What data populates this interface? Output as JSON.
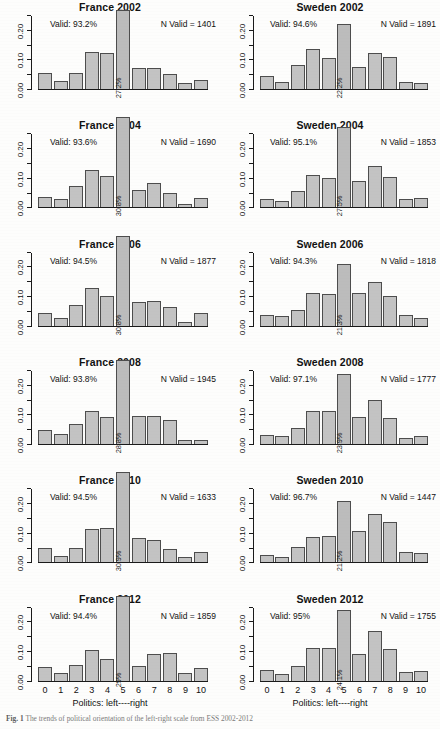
{
  "figure": {
    "caption_label": "Fig. 1",
    "caption_text": "The trends of political orientation of the left-right scale from ESS 2002-2012"
  },
  "axis": {
    "y_ticks": [
      "0.00",
      "0.10",
      "0.20"
    ],
    "y_min": 0.0,
    "y_max": 0.25,
    "x_labels": [
      "0",
      "1",
      "2",
      "3",
      "4",
      "5",
      "6",
      "7",
      "8",
      "9",
      "10"
    ],
    "x_title": "Politics: left----right"
  },
  "chart_data": {
    "type": "bar",
    "title": "The trends of political orientation of the left-right scale from ESS 2002-2012",
    "xlabel": "Politics: left----right",
    "ylabel": "Proportion",
    "ylim": [
      0,
      0.25
    ],
    "grid": false,
    "legend": "none",
    "categories": [
      "0",
      "1",
      "2",
      "3",
      "4",
      "5",
      "6",
      "7",
      "8",
      "9",
      "10"
    ],
    "panels": [
      {
        "title": "France 2002",
        "country": "France",
        "year": "2002",
        "valid_label": "Valid: 93.2%",
        "n_valid_label": "N Valid = 1401",
        "valid_pct": 93.2,
        "n_valid": 1401,
        "peak_label": "27.2%",
        "peak_category": "5",
        "values": [
          0.056,
          0.03,
          0.059,
          0.128,
          0.126,
          0.272,
          0.075,
          0.074,
          0.053,
          0.025,
          0.035
        ]
      },
      {
        "title": "Sweden 2002",
        "country": "Sweden",
        "year": "2002",
        "valid_label": "Valid: 94.6%",
        "n_valid_label": "N Valid = 1891",
        "valid_pct": 94.6,
        "n_valid": 1891,
        "peak_label": "22.2%",
        "peak_category": "5",
        "values": [
          0.047,
          0.028,
          0.086,
          0.137,
          0.107,
          0.222,
          0.079,
          0.126,
          0.11,
          0.026,
          0.025
        ]
      },
      {
        "title": "France 2004",
        "country": "France",
        "year": "2004",
        "valid_label": "Valid: 93.6%",
        "n_valid_label": "N Valid = 1690",
        "valid_pct": 93.6,
        "n_valid": 1690,
        "peak_label": "30.8%",
        "peak_category": "5",
        "values": [
          0.039,
          0.033,
          0.076,
          0.131,
          0.108,
          0.308,
          0.062,
          0.084,
          0.053,
          0.013,
          0.034
        ]
      },
      {
        "title": "Sweden 2004",
        "country": "Sweden",
        "year": "2004",
        "valid_label": "Valid: 95.1%",
        "n_valid_label": "N Valid = 1853",
        "valid_pct": 95.1,
        "n_valid": 1853,
        "peak_label": "27.5%",
        "peak_category": "5",
        "values": [
          0.032,
          0.024,
          0.06,
          0.114,
          0.102,
          0.275,
          0.094,
          0.142,
          0.105,
          0.032,
          0.035
        ]
      },
      {
        "title": "France 2006",
        "country": "France",
        "year": "2006",
        "valid_label": "Valid: 94.5%",
        "n_valid_label": "N Valid = 1877",
        "valid_pct": 94.5,
        "n_valid": 1877,
        "peak_label": "30.8%",
        "peak_category": "5",
        "values": [
          0.047,
          0.03,
          0.073,
          0.129,
          0.103,
          0.308,
          0.085,
          0.086,
          0.066,
          0.017,
          0.046
        ]
      },
      {
        "title": "Sweden 2006",
        "country": "Sweden",
        "year": "2006",
        "valid_label": "Valid: 94.3%",
        "n_valid_label": "N Valid = 1818",
        "valid_pct": 94.3,
        "n_valid": 1818,
        "peak_label": "21.3%",
        "peak_category": "5",
        "values": [
          0.04,
          0.037,
          0.056,
          0.113,
          0.11,
          0.213,
          0.113,
          0.151,
          0.104,
          0.038,
          0.03
        ]
      },
      {
        "title": "France 2008",
        "country": "France",
        "year": "2008",
        "valid_label": "Valid: 93.8%",
        "n_valid_label": "N Valid = 1945",
        "valid_pct": 93.8,
        "n_valid": 1945,
        "peak_label": "28.8%",
        "peak_category": "5",
        "values": [
          0.05,
          0.036,
          0.072,
          0.116,
          0.095,
          0.288,
          0.099,
          0.098,
          0.086,
          0.018,
          0.018
        ]
      },
      {
        "title": "Sweden 2008",
        "country": "Sweden",
        "year": "2008",
        "valid_label": "Valid: 97.1%",
        "n_valid_label": "N Valid = 1777",
        "valid_pct": 97.1,
        "n_valid": 1777,
        "peak_label": "23.9%",
        "peak_category": "5",
        "values": [
          0.033,
          0.032,
          0.059,
          0.116,
          0.116,
          0.239,
          0.095,
          0.153,
          0.092,
          0.024,
          0.029
        ]
      },
      {
        "title": "France 2010",
        "country": "France",
        "year": "2010",
        "valid_label": "Valid: 94.5%",
        "n_valid_label": "N Valid = 1633",
        "valid_pct": 94.5,
        "n_valid": 1633,
        "peak_label": "30.9%",
        "peak_category": "5",
        "values": [
          0.052,
          0.026,
          0.052,
          0.116,
          0.121,
          0.309,
          0.086,
          0.078,
          0.05,
          0.02,
          0.038
        ]
      },
      {
        "title": "Sweden 2010",
        "country": "Sweden",
        "year": "2010",
        "valid_label": "Valid: 96.7%",
        "n_valid_label": "N Valid = 1447",
        "valid_pct": 96.7,
        "n_valid": 1447,
        "peak_label": "21.2%",
        "peak_category": "5",
        "values": [
          0.028,
          0.021,
          0.056,
          0.09,
          0.092,
          0.212,
          0.108,
          0.168,
          0.138,
          0.037,
          0.034
        ]
      },
      {
        "title": "France 2012",
        "country": "France",
        "year": "2012",
        "valid_label": "Valid: 94.4%",
        "n_valid_label": "N Valid = 1859",
        "valid_pct": 94.4,
        "n_valid": 1859,
        "peak_label": "29%",
        "peak_category": "5",
        "values": [
          0.05,
          0.028,
          0.058,
          0.107,
          0.076,
          0.29,
          0.053,
          0.093,
          0.096,
          0.029,
          0.047
        ]
      },
      {
        "title": "Sweden 2012",
        "country": "Sweden",
        "year": "2012",
        "valid_label": "Valid: 95%",
        "n_valid_label": "N Valid = 1755",
        "valid_pct": 95.0,
        "n_valid": 1755,
        "peak_label": "24.1%",
        "peak_category": "5",
        "values": [
          0.039,
          0.026,
          0.054,
          0.114,
          0.115,
          0.241,
          0.093,
          0.17,
          0.109,
          0.034,
          0.036
        ]
      }
    ]
  }
}
